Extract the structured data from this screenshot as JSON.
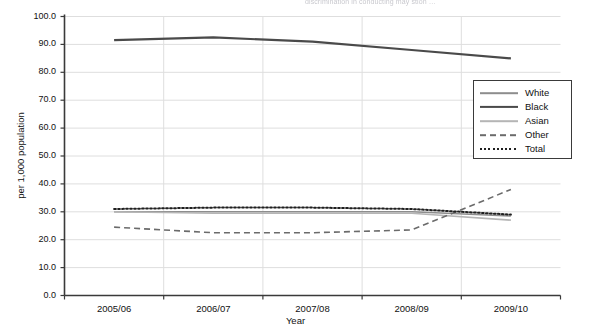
{
  "top_caption": "discrimination in conducting  may  stion …",
  "chart_data": {
    "type": "line",
    "title": "",
    "xlabel": "Year",
    "ylabel": "per 1,000 population",
    "categories": [
      "2005/06",
      "2006/07",
      "2007/08",
      "2008/09",
      "2009/10"
    ],
    "ylim": [
      0.0,
      100.0
    ],
    "ytick_step": 10.0,
    "ytick_labels": [
      "0.0",
      "10.0",
      "20.0",
      "30.0",
      "40.0",
      "50.0",
      "60.0",
      "70.0",
      "80.0",
      "90.0",
      "100.0"
    ],
    "grid": true,
    "legend_position": "top-right-inside",
    "series": [
      {
        "name": "White",
        "values": [
          30.0,
          30.0,
          30.0,
          30.0,
          28.5
        ],
        "color": "#8d8d8d",
        "style": "solid",
        "width": 1.6
      },
      {
        "name": "Black",
        "values": [
          91.5,
          92.5,
          91.0,
          88.0,
          85.0
        ],
        "color": "#4a4a4a",
        "style": "solid",
        "width": 2.2
      },
      {
        "name": "Asian",
        "values": [
          30.0,
          29.5,
          29.5,
          29.5,
          27.0
        ],
        "color": "#b5b5b5",
        "style": "solid",
        "width": 1.6
      },
      {
        "name": "Other",
        "values": [
          24.5,
          22.5,
          22.5,
          23.5,
          38.0
        ],
        "color": "#6b6b6b",
        "style": "dashed",
        "width": 1.6
      },
      {
        "name": "Total",
        "values": [
          31.0,
          31.5,
          31.5,
          31.0,
          29.0
        ],
        "color": "#1f1f1f",
        "style": "dotted",
        "width": 2.0
      }
    ]
  },
  "colors": {
    "axis": "#3a3a3a",
    "grid": "#dedede",
    "background": "#ffffff",
    "text": "#111111"
  }
}
